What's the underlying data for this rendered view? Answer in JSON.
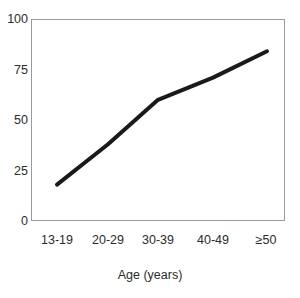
{
  "chart_data": {
    "type": "line",
    "title": "",
    "subtitle": "",
    "xlabel": "Age (years)",
    "ylabel": "",
    "categories": [
      "13-19",
      "20-29",
      "30-39",
      "40-49",
      "≥50"
    ],
    "values": [
      18,
      38,
      60,
      71,
      84
    ],
    "series": [
      {
        "name": "",
        "values": [
          18,
          38,
          60,
          71,
          84
        ]
      }
    ],
    "xtick_labels": [
      "13-19",
      "20-29",
      "30-39",
      "40-49",
      "≥50"
    ],
    "ytick_labels": [
      "0",
      "25",
      "50",
      "75",
      "100"
    ],
    "ytick_values": [
      0,
      25,
      50,
      75,
      100
    ],
    "ylim": [
      0,
      100
    ],
    "grid": false,
    "legend": false,
    "legend_position": "none",
    "markers": false,
    "line_color": "#1a1a1a",
    "line_width": 4,
    "frame_color": "#9a9a9a",
    "background_color": "#ffffff",
    "text_color": "#2b2b2b"
  },
  "axes": {
    "y": {
      "ticks": [
        {
          "label": "100",
          "value": 100
        },
        {
          "label": "75",
          "value": 75
        },
        {
          "label": "50",
          "value": 50
        },
        {
          "label": "25",
          "value": 25
        },
        {
          "label": "0",
          "value": 0
        }
      ]
    },
    "x": {
      "title": "Age (years)",
      "ticks": [
        {
          "label": "13-19"
        },
        {
          "label": "20-29"
        },
        {
          "label": "30-39"
        },
        {
          "label": "40-49"
        },
        {
          "label": "≥50"
        }
      ]
    }
  }
}
